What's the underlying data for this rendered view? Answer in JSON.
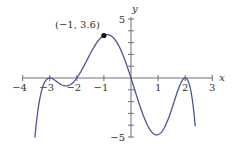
{
  "chart_data": {
    "type": "line",
    "title": "",
    "xlabel": "x",
    "ylabel": "y",
    "xlim": [
      -4,
      3
    ],
    "ylim": [
      -5,
      5
    ],
    "x_ticks": [
      -4,
      -3,
      -2,
      -1,
      1,
      2,
      3
    ],
    "x_tick_labels": [
      "−4",
      "−3",
      "−2",
      "−1",
      "1",
      "2",
      "3"
    ],
    "y_ticks": [
      -5,
      -4,
      -3,
      -2,
      -1,
      1,
      2,
      3,
      4,
      5
    ],
    "y_tick_labels_shown": {
      "5": "5",
      "-5": "−5"
    },
    "grid": false,
    "legend": null,
    "series": [
      {
        "name": "f(x)",
        "formula": "-0.1*x*(x+2)*(x+3)^2*(x-2)^2",
        "x_range": [
          -3.55,
          2.37
        ],
        "color": "#4a5596",
        "key_points": [
          {
            "x": -3,
            "y": 0,
            "note": "touches axis (double root)"
          },
          {
            "x": -2.5,
            "y": -0.8,
            "note": "local minimum approx"
          },
          {
            "x": -2,
            "y": 0,
            "note": "root"
          },
          {
            "x": -1,
            "y": 3.6,
            "note": "labeled point"
          },
          {
            "x": 0,
            "y": 0,
            "note": "root"
          },
          {
            "x": 1,
            "y": -4.8,
            "note": "local minimum approx"
          },
          {
            "x": 2,
            "y": 0,
            "note": "touches axis (double root)"
          }
        ]
      }
    ],
    "annotations": [
      {
        "text": "(−1, 3.6)",
        "x": -1,
        "y": 3.6,
        "marker": "filled-circle"
      }
    ]
  }
}
